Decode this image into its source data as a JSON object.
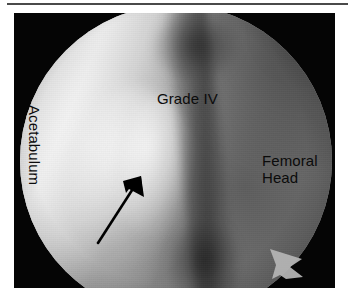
{
  "figure": {
    "type": "arthroscopic-photograph",
    "view": "hip arthroscopy, circular endoscopic field",
    "panel_background": "#050505",
    "page_background": "#ffffff",
    "rule_color": "#4a4a4a"
  },
  "annotations": {
    "label_color": "#0b0b0b",
    "grade": {
      "text": "Grade IV",
      "x": 157,
      "y": 90
    },
    "femoral_head": {
      "line1": "Femoral",
      "line2": "Head",
      "x": 262,
      "y": 152
    },
    "acetabulum": {
      "text": "Acetabulum",
      "x": 43,
      "y": 105,
      "rotation_deg": 90
    }
  },
  "markers": {
    "pointer_arrow": {
      "name": "black-pointer-arrow",
      "color": "#000000",
      "tail_x": 98,
      "tail_y": 243,
      "tip_x": 141,
      "tip_y": 176
    },
    "rim_arrowhead": {
      "name": "light-arrowhead-marker",
      "color": "#b0b0b0",
      "x": 286,
      "y": 262
    }
  },
  "scope_field": {
    "center_x": 176,
    "center_y": 148,
    "diameter": 312,
    "rim_color": "#050505"
  }
}
